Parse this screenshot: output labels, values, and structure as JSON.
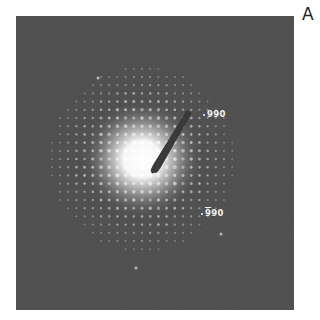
{
  "figure": {
    "panel_label": "A",
    "type": "electron diffraction pattern",
    "background_color": "#4a4a4a",
    "spot_color": "#ffffff",
    "lattice": "square spot lattice",
    "annotations": [
      {
        "text": "990",
        "overbar_first_digit": false,
        "position": "upper right of beam stop"
      },
      {
        "digit_barred": "9",
        "rest": "90",
        "text": "-990",
        "overbar_first_digit": true,
        "position": "lower right"
      }
    ],
    "beam_stop": {
      "present": true,
      "direction": "from center toward upper right"
    }
  }
}
